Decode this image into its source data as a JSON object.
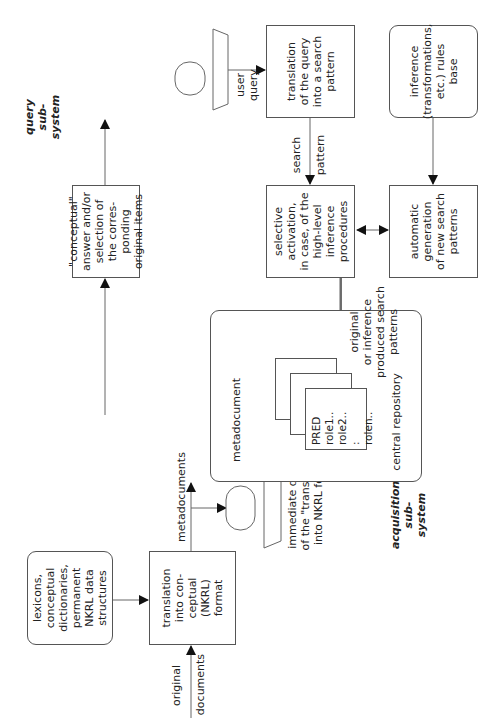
{
  "diagram": {
    "title_query": "query sub-system",
    "title_acquisition": "acquisition sub-system",
    "nodes": {
      "lexicons": "lexicons,\nconceptual\ndictionaries,\npermanent\nNKRL data\nstructures",
      "translation_nkrl": "translation\ninto con-\nceptual\n(NKRL)\nformat",
      "display_caption": "immediate display\nof the \"translation\"\ninto NKRL format",
      "central_repository": "central repository",
      "metadocument": "metadocument",
      "pred_text": "PRED role1..\n      role2..\n        :\n      rolen..",
      "conceptual_answer": "\"conceptual\"\nanswer and/or\nselection of\nthe corres-\nponding\noriginal items",
      "translation_query": "translation\nof the query\ninto a search\npattern",
      "selective_activation": "selective\nactivation,\nin case, of the\nhigh-level\ninference\nprocedures",
      "automatic_generation": "automatic\ngeneration\nof new search\npatterns",
      "inference_rules": "inference\n(transformations,\netc.) rules\nbase"
    },
    "edge_labels": {
      "original_documents_1": "original",
      "original_documents_2": "documents",
      "metadocuments": "metadocuments",
      "user_query": "user\nquery",
      "search_pattern_1": "search",
      "search_pattern_2": "pattern",
      "produced_patterns": "original\nor inference\nproduced search\npatterns"
    }
  }
}
